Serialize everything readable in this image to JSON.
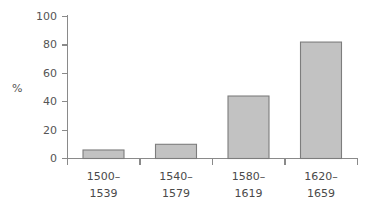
{
  "chart_data": {
    "type": "bar",
    "title": "",
    "subtitle": "",
    "xlabel": "",
    "ylabel": "%",
    "categories": [
      "1500–\n1539",
      "1540–\n1579",
      "1580–\n1619",
      "1620–\n1659"
    ],
    "category_lines": [
      [
        "1500–",
        "1539"
      ],
      [
        "1540–",
        "1579"
      ],
      [
        "1580–",
        "1619"
      ],
      [
        "1620–",
        "1659"
      ]
    ],
    "values": [
      6,
      10,
      44,
      82
    ],
    "ylim": [
      0,
      100
    ],
    "yticks": [
      0,
      20,
      40,
      60,
      80,
      100
    ],
    "ytick_labels": [
      "0",
      "20",
      "40",
      "60",
      "80",
      "100"
    ],
    "grid": false,
    "legend": null,
    "legend_position": "none",
    "annotations": [],
    "colors": {
      "bar_fill": "#c2c2c2",
      "bar_stroke": "#7d7d7d",
      "axis": "#8a8a8a",
      "text": "#555555",
      "background": "#ffffff"
    }
  }
}
